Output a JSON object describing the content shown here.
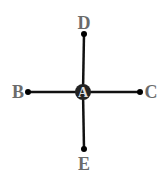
{
  "diagram": {
    "type": "star-graph",
    "center": {
      "id": "A",
      "label": "A",
      "x": 83,
      "y": 92
    },
    "nodes": [
      {
        "id": "D",
        "label": "D",
        "x": 84,
        "y": 34,
        "label_x": 84,
        "label_y": 29,
        "position": "top"
      },
      {
        "id": "B",
        "label": "B",
        "x": 28,
        "y": 92,
        "label_x": 18,
        "label_y": 98,
        "position": "left"
      },
      {
        "id": "C",
        "label": "C",
        "x": 140,
        "y": 92,
        "label_x": 151,
        "label_y": 98,
        "position": "right"
      },
      {
        "id": "E",
        "label": "E",
        "x": 84,
        "y": 149,
        "label_x": 84,
        "label_y": 170,
        "position": "bottom"
      }
    ],
    "edges": [
      {
        "from": "A",
        "to": "D"
      },
      {
        "from": "A",
        "to": "B"
      },
      {
        "from": "A",
        "to": "C"
      },
      {
        "from": "A",
        "to": "E"
      }
    ],
    "colors": {
      "edge": "#111111",
      "node": "#111111",
      "label": "#6b6b6b",
      "center_fill": "#222222",
      "center_label": "#dddddd"
    }
  }
}
